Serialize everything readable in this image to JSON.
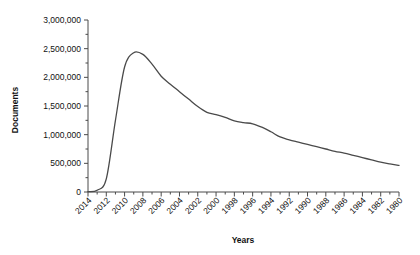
{
  "chart_data": {
    "type": "line",
    "title": "",
    "xlabel": "Years",
    "ylabel": "Documents",
    "xlim": [
      2014,
      1980
    ],
    "ylim": [
      0,
      3000000
    ],
    "x_reversed": true,
    "grid": false,
    "legend": null,
    "y_ticks": [
      0,
      500000,
      1000000,
      1500000,
      2000000,
      2500000,
      3000000
    ],
    "y_tick_labels": [
      "0",
      "500,000",
      "1,000,000",
      "1,500,000",
      "2,000,000",
      "2,500,000",
      "3,000,000"
    ],
    "x_ticks": [
      2014,
      2012,
      2010,
      2008,
      2006,
      2004,
      2002,
      2000,
      1998,
      1996,
      1994,
      1992,
      1990,
      1988,
      1986,
      1984,
      1982,
      1980
    ],
    "x_tick_labels": [
      "2014",
      "2012",
      "2010",
      "2008",
      "2006",
      "2004",
      "2002",
      "2000",
      "1998",
      "1996",
      "1994",
      "1992",
      "1990",
      "1988",
      "1986",
      "1984",
      "1982",
      "1980"
    ],
    "x_minor_tick_step": 1,
    "series": [
      {
        "name": "Documents",
        "color": "#4a4a4a",
        "x": [
          2014,
          2013,
          2012,
          2011,
          2010,
          2009,
          2008,
          2007,
          2006,
          2005,
          2004,
          2003,
          2002,
          2001,
          2000,
          1999,
          1998,
          1997,
          1996,
          1995,
          1994,
          1993,
          1992,
          1991,
          1990,
          1989,
          1988,
          1987,
          1986,
          1985,
          1984,
          1983,
          1982,
          1981,
          1980
        ],
        "values": [
          5000,
          30000,
          230000,
          1250000,
          2180000,
          2430000,
          2400000,
          2230000,
          2020000,
          1880000,
          1750000,
          1620000,
          1490000,
          1390000,
          1350000,
          1300000,
          1240000,
          1210000,
          1190000,
          1130000,
          1050000,
          960000,
          910000,
          870000,
          830000,
          790000,
          750000,
          710000,
          680000,
          640000,
          600000,
          560000,
          520000,
          490000,
          465000
        ]
      }
    ]
  }
}
